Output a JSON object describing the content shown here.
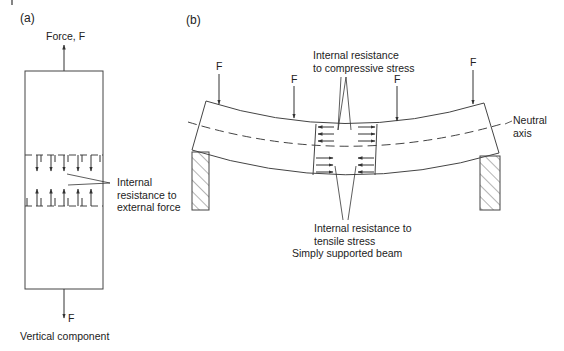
{
  "panels": {
    "a": {
      "label": "(a)",
      "top_force": "Force, F",
      "bottom_force": "F",
      "annotation_line1": "Internal",
      "annotation_line2": "resistance to",
      "annotation_line3": "external force",
      "caption": "Vertical component"
    },
    "b": {
      "label": "(b)",
      "forces": [
        "F",
        "F",
        "F",
        "F"
      ],
      "compressive_line1": "Internal resistance",
      "compressive_line2": "to compressive stress",
      "tensile_line1": "Internal resistance to",
      "tensile_line2": "tensile stress",
      "neutral_line1": "Neutral",
      "neutral_line2": "axis",
      "caption": "Simply supported beam"
    }
  },
  "colors": {
    "stroke": "#333333",
    "text": "#222222"
  }
}
